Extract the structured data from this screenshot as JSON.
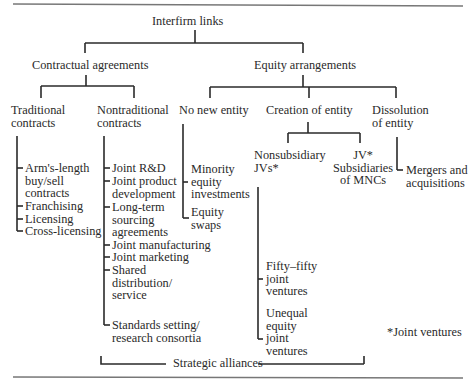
{
  "diagram": {
    "root": "Interfirm links",
    "level1": {
      "contractual": "Contractual agreements",
      "equity": "Equity arrangements"
    },
    "contractual_children": {
      "traditional": {
        "label": "Traditional\ncontracts",
        "items": [
          "Arm's-length\nbuy/sell\ncontracts",
          "Franchising",
          "Licensing",
          "Cross-licensing"
        ]
      },
      "nontraditional": {
        "label": "Nontraditional\ncontracts",
        "items": [
          "Joint R&D",
          "Joint product\ndevelopment",
          "Long-term\nsourcing\nagreements",
          "Joint manufacturing",
          "Joint marketing",
          "Shared\ndistribution/\nservice",
          "Standards setting/\nresearch consortia"
        ]
      }
    },
    "equity_children": {
      "no_new_entity": {
        "label": "No new entity",
        "items": [
          "Minority\nequity\ninvestments",
          "Equity\nswaps"
        ]
      },
      "creation_of_entity": {
        "label": "Creation of entity",
        "nonsubsidiary": {
          "label": "Nonsubsidiary\nJVs*",
          "items": [
            "Fifty–fifty\njoint\nventures",
            "Unequal\nequity\njoint\nventures"
          ]
        },
        "subsidiaries": {
          "label": "JV*\nSubsidiaries\nof MNCs"
        }
      },
      "dissolution": {
        "label": "Dissolution\nof entity",
        "items": [
          "Mergers and\nacquisitions"
        ]
      }
    },
    "footnote": "*Joint ventures",
    "bracket_label": "Strategic alliances"
  }
}
